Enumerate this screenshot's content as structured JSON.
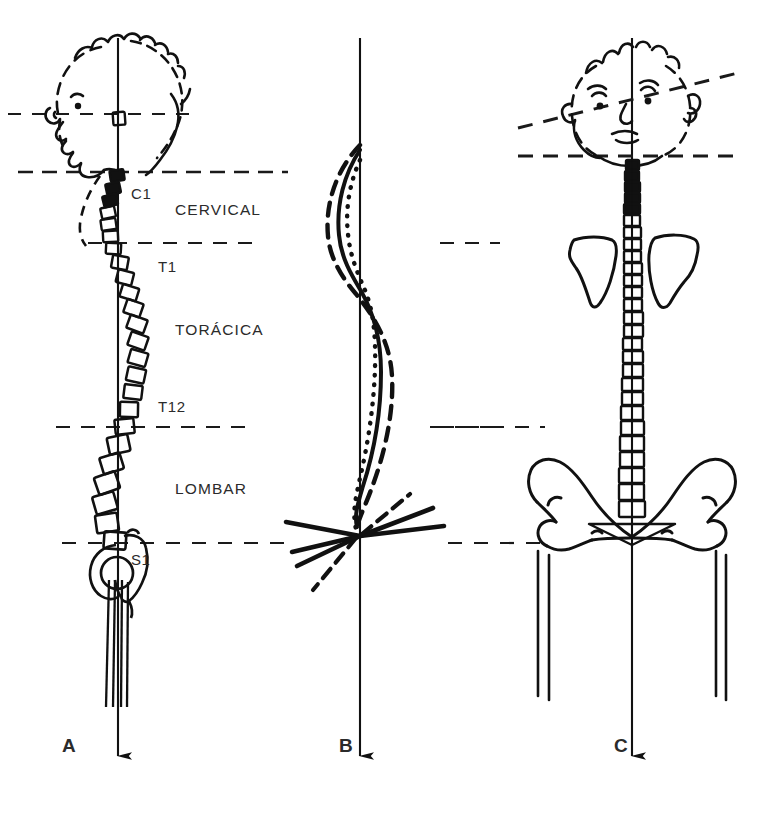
{
  "figure": {
    "background_color": "#ffffff",
    "ink_color": "#111111",
    "width": 761,
    "height": 820
  },
  "panels": [
    {
      "id": "A",
      "letter": "A",
      "letter_x": 62,
      "letter_y": 752,
      "view": "lateral",
      "plumb_line_x": 118,
      "region_labels": [
        {
          "text": "CERVICAL",
          "x": 175,
          "y": 215
        },
        {
          "text": "TORÁCICA",
          "x": 175,
          "y": 335
        },
        {
          "text": "LOMBAR",
          "x": 175,
          "y": 494
        }
      ],
      "vertebra_labels": [
        {
          "text": "C1",
          "x": 131,
          "y": 199
        },
        {
          "text": "T1",
          "x": 158,
          "y": 272
        },
        {
          "text": "T12",
          "x": 158,
          "y": 412
        },
        {
          "text": "S1",
          "x": 131,
          "y": 565
        }
      ],
      "reference_lines": [
        {
          "name": "orbital-line",
          "y": 114,
          "x1": 8,
          "x2": 196,
          "style": "dashed"
        },
        {
          "name": "occiput-line",
          "y": 172,
          "x1": 18,
          "x2": 288,
          "style": "dashed"
        },
        {
          "name": "t1-line",
          "y": 243,
          "x1": 88,
          "x2": 262,
          "style": "dashed"
        },
        {
          "name": "t12-line",
          "y": 427,
          "x1": 56,
          "x2": 256,
          "style": "dashed"
        },
        {
          "name": "s1-line",
          "y": 543,
          "x1": 62,
          "x2": 286,
          "style": "dashed"
        }
      ]
    },
    {
      "id": "B",
      "letter": "B",
      "letter_x": 339,
      "letter_y": 752,
      "view": "curve-variants",
      "plumb_line_x": 360,
      "curve_styles": [
        "solid",
        "dotted",
        "dashed"
      ],
      "reference_lines": [
        {
          "name": "t12-line",
          "y": 427,
          "x1": 440,
          "x2": 545,
          "style": "dashed"
        },
        {
          "name": "s1-line",
          "y": 543,
          "x1": 448,
          "x2": 548,
          "style": "dashed"
        }
      ],
      "pelvic_tilt_rays": 5
    },
    {
      "id": "C",
      "letter": "C",
      "letter_x": 614,
      "letter_y": 752,
      "view": "frontal",
      "plumb_line_x": 632,
      "reference_lines": [
        {
          "name": "bi-ocular-tilted-line",
          "style": "dashed",
          "tilted": true
        },
        {
          "name": "shoulder-base-line",
          "y": 156,
          "x1": 518,
          "x2": 742,
          "style": "dashed"
        },
        {
          "name": "t12-line",
          "y": 243,
          "x1": 440,
          "x2": 500,
          "style": "dashed"
        },
        {
          "name": "iliac-crest-line",
          "y": 427,
          "x1": 430,
          "x2": 500,
          "style": "dashed"
        },
        {
          "name": "s1-line",
          "y": 543,
          "x1": 448,
          "x2": 520,
          "style": "dashed"
        }
      ]
    }
  ]
}
